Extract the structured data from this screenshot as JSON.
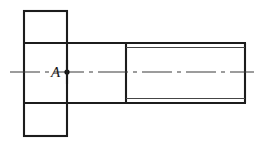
{
  "drawing": {
    "title": "Bolt / screw orthographic section view",
    "type": "engineering-line-drawing",
    "canvas": {
      "width": 263,
      "height": 145,
      "background": "#ffffff"
    },
    "colors": {
      "outline": "#1c1c1c",
      "thread": "#454545",
      "centerline": "#3a3a3a",
      "marker": "#141414",
      "label": "#1a1a1a"
    },
    "labels": {
      "point_a": "A"
    },
    "geometry": {
      "head": {
        "x1": 24,
        "y1": 11,
        "x2": 67,
        "y2": 136
      },
      "shoulder": {
        "x1": 67,
        "y1": 43,
        "x2": 126,
        "y2": 103
      },
      "threaded_shank": {
        "x1": 126,
        "y1": 43,
        "x2": 246,
        "y2": 103
      },
      "thread_root_top_y": 47,
      "thread_root_bottom_y": 99,
      "axis_y": 72,
      "axis_x1": 10,
      "axis_x2": 254,
      "marker_point": {
        "x": 67,
        "y": 72,
        "r": 2.6
      },
      "label_a_position": {
        "x": 51,
        "y": 76
      }
    }
  }
}
